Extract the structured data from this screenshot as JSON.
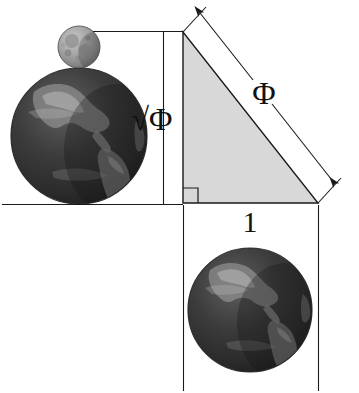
{
  "figure": {
    "background_color": "#ffffff",
    "line_color": "#1a1a1a",
    "triangle_fill": "#d8d8d8",
    "triangle_stroke": "#1a1a1a",
    "earth_color_dark": "#1d1d1d",
    "earth_color_mid": "#4a4a4a",
    "earth_color_light": "#b9b9b9",
    "moon_color_dark": "#6e6e6e",
    "moon_color_light": "#c9c9c9"
  },
  "labels": {
    "vertical_leg": "√Φ",
    "hypotenuse": "Φ",
    "horizontal_leg": "1"
  },
  "geometry": {
    "apex": {
      "x": 183,
      "y": 32
    },
    "right_angle": {
      "x": 183,
      "y": 203
    },
    "bottom_right": {
      "x": 318,
      "y": 203
    },
    "vertical_leg_length": 171,
    "horizontal_leg_length": 135,
    "right_angle_marker_size": 15
  },
  "bodies": {
    "earth_top": {
      "cx": 79,
      "cy": 136,
      "r": 68,
      "name": "Earth"
    },
    "moon_top": {
      "cx": 79,
      "cy": 47,
      "r": 21,
      "name": "Moon"
    },
    "earth_bottom": {
      "cx": 250,
      "cy": 310,
      "r": 62,
      "name": "Earth"
    }
  }
}
